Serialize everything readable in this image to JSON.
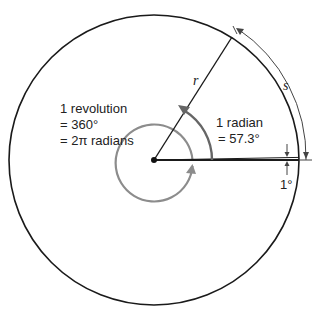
{
  "diagram": {
    "labels": {
      "radius": "r",
      "arc_length": "s",
      "revolution_line1": "1 revolution",
      "revolution_line2": "= 360°",
      "revolution_line3": "= 2π radians",
      "radian_line1": "1 radian",
      "radian_line2": "= 57.3°",
      "degree": "1°"
    },
    "colors": {
      "circle": "#1a1a1a",
      "revolution_arc": "#8c8c8c",
      "radian_arc": "#666666",
      "text": "#222222"
    }
  }
}
